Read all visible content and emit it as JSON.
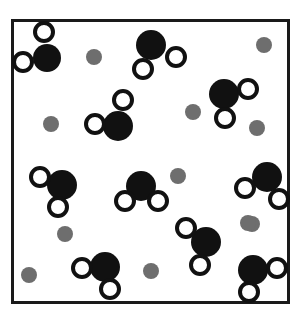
{
  "figure": {
    "type": "molecular-scene-diagram",
    "caption": "",
    "width": 300,
    "height": 327,
    "background_color": "#ffffff"
  },
  "frame": {
    "label": "container-box",
    "x": 11,
    "y": 19,
    "width": 279,
    "height": 285,
    "border_width": 3,
    "border_color": "#1a1a1a",
    "fill_color": "#ffffff"
  },
  "legend": {
    "species": [
      {
        "name": "oxygen-atom",
        "symbol": "O",
        "color": "#111111",
        "style": "filled-black-circle",
        "radius": 14
      },
      {
        "name": "hydrogen-atom",
        "symbol": "H",
        "color": "#ffffff",
        "outline": "#111111",
        "style": "open-circle",
        "radius": 11
      },
      {
        "name": "ion-particle",
        "symbol": "",
        "color": "#6e6e6e",
        "style": "filled-gray-circle",
        "radius": 8
      }
    ]
  },
  "counts": {
    "water_molecules": 10,
    "gray_particles": 11,
    "total_large_black_circles": 10,
    "total_open_circles": 20
  },
  "molecules": [
    {
      "id": "molecule-1",
      "label": "water-top-left",
      "oxygen": {
        "cx": 47,
        "cy": 58,
        "r": 14
      },
      "hydrogens": [
        {
          "cx": 44,
          "cy": 32,
          "r": 11
        },
        {
          "cx": 23,
          "cy": 62,
          "r": 11
        }
      ]
    },
    {
      "id": "molecule-2",
      "label": "water-top-center",
      "oxygen": {
        "cx": 151,
        "cy": 45,
        "r": 15
      },
      "hydrogens": [
        {
          "cx": 143,
          "cy": 69,
          "r": 11
        },
        {
          "cx": 176,
          "cy": 57,
          "r": 11
        }
      ]
    },
    {
      "id": "molecule-3",
      "label": "water-upper-right",
      "oxygen": {
        "cx": 224,
        "cy": 94,
        "r": 15
      },
      "hydrogens": [
        {
          "cx": 248,
          "cy": 89,
          "r": 11
        },
        {
          "cx": 225,
          "cy": 118,
          "r": 11
        }
      ]
    },
    {
      "id": "molecule-4",
      "label": "water-mid-left-upper",
      "oxygen": {
        "cx": 118,
        "cy": 126,
        "r": 15
      },
      "hydrogens": [
        {
          "cx": 123,
          "cy": 100,
          "r": 11
        },
        {
          "cx": 95,
          "cy": 124,
          "r": 11
        }
      ]
    },
    {
      "id": "molecule-5",
      "label": "water-mid-left",
      "oxygen": {
        "cx": 62,
        "cy": 185,
        "r": 15
      },
      "hydrogens": [
        {
          "cx": 40,
          "cy": 177,
          "r": 11
        },
        {
          "cx": 58,
          "cy": 207,
          "r": 11
        }
      ]
    },
    {
      "id": "molecule-6",
      "label": "water-center",
      "oxygen": {
        "cx": 141,
        "cy": 186,
        "r": 15
      },
      "hydrogens": [
        {
          "cx": 125,
          "cy": 201,
          "r": 11
        },
        {
          "cx": 158,
          "cy": 201,
          "r": 11
        }
      ]
    },
    {
      "id": "molecule-7",
      "label": "water-mid-right",
      "oxygen": {
        "cx": 267,
        "cy": 177,
        "r": 15
      },
      "hydrogens": [
        {
          "cx": 245,
          "cy": 188,
          "r": 11
        },
        {
          "cx": 279,
          "cy": 199,
          "r": 11
        }
      ]
    },
    {
      "id": "molecule-8",
      "label": "water-lower-center-right",
      "oxygen": {
        "cx": 206,
        "cy": 242,
        "r": 15
      },
      "hydrogens": [
        {
          "cx": 186,
          "cy": 228,
          "r": 11
        },
        {
          "cx": 200,
          "cy": 265,
          "r": 11
        }
      ]
    },
    {
      "id": "molecule-9",
      "label": "water-bottom-left",
      "oxygen": {
        "cx": 105,
        "cy": 267,
        "r": 15
      },
      "hydrogens": [
        {
          "cx": 82,
          "cy": 268,
          "r": 11
        },
        {
          "cx": 110,
          "cy": 289,
          "r": 11
        }
      ]
    },
    {
      "id": "molecule-10",
      "label": "water-bottom-right",
      "oxygen": {
        "cx": 253,
        "cy": 270,
        "r": 15
      },
      "hydrogens": [
        {
          "cx": 277,
          "cy": 268,
          "r": 11
        },
        {
          "cx": 249,
          "cy": 292,
          "r": 11
        }
      ]
    }
  ],
  "gray_particles": [
    {
      "id": "ion-1",
      "label": "gray-particle-top-left",
      "cx": 94,
      "cy": 57,
      "r": 8
    },
    {
      "id": "ion-2",
      "label": "gray-particle-top-right",
      "cx": 264,
      "cy": 45,
      "r": 8
    },
    {
      "id": "ion-3",
      "label": "gray-particle-upper-mid",
      "cx": 193,
      "cy": 112,
      "r": 8
    },
    {
      "id": "ion-4",
      "label": "gray-particle-left-upper",
      "cx": 51,
      "cy": 124,
      "r": 8
    },
    {
      "id": "ion-5",
      "label": "gray-particle-right-upper",
      "cx": 257,
      "cy": 128,
      "r": 8
    },
    {
      "id": "ion-6",
      "label": "gray-particle-center",
      "cx": 178,
      "cy": 176,
      "r": 8
    },
    {
      "id": "ion-7",
      "label": "gray-particle-left-mid",
      "cx": 65,
      "cy": 234,
      "r": 8
    },
    {
      "id": "ion-8",
      "label": "gray-particle-right-mid",
      "cx": 252,
      "cy": 224,
      "r": 8
    },
    {
      "id": "ion-9",
      "label": "gray-particle-bottom-left",
      "cx": 29,
      "cy": 275,
      "r": 8
    },
    {
      "id": "ion-10",
      "label": "gray-particle-bottom-mid",
      "cx": 151,
      "cy": 271,
      "r": 8
    },
    {
      "id": "ion-11",
      "label": "gray-particle-right-lower",
      "cx": 248,
      "cy": 223,
      "r": 8
    }
  ]
}
